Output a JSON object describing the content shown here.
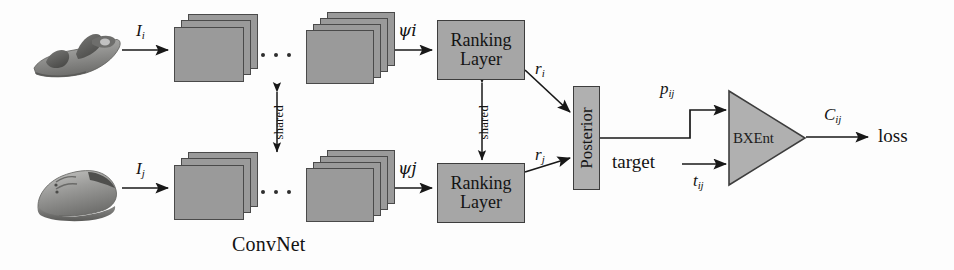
{
  "figure": {
    "type": "neural-network-architecture-diagram",
    "caption_label": "ConvNet",
    "colors": {
      "background": "#fdfdfd",
      "node_fill": "#a6a6a6",
      "feature_map_fill": "#9a9a9a",
      "stroke": "#3d3d3d",
      "text": "#141414"
    }
  },
  "branches": {
    "top": {
      "input_icon": "sandal-photo",
      "input_label": "I",
      "input_sub": "i",
      "feature_label": "ψ",
      "feature_sub": "i",
      "node_line1": "Ranking",
      "node_line2": "Layer",
      "output_label": "r",
      "output_sub": "i"
    },
    "bottom": {
      "input_icon": "shoe-photo",
      "input_label": "I",
      "input_sub": "j",
      "feature_label": "ψ",
      "feature_sub": "j",
      "node_line1": "Ranking",
      "node_line2": "Layer",
      "output_label": "r",
      "output_sub": "j"
    }
  },
  "shared_markers": [
    {
      "label": "shared"
    },
    {
      "label": "shared"
    }
  ],
  "ellipsis": [
    {
      "label": "..."
    },
    {
      "label": "..."
    }
  ],
  "posterior": {
    "label": "Posterior",
    "out_label": "p",
    "out_sub": "ij"
  },
  "target": {
    "label": "target",
    "edge_label": "t",
    "edge_sub": "ij"
  },
  "criterion": {
    "label": "BXEnt",
    "out_label": "C",
    "out_sub": "ij",
    "sink_label": "loss"
  }
}
